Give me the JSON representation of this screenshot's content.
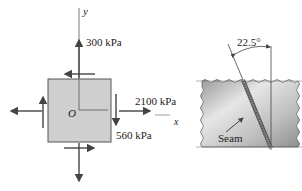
{
  "element": {
    "y_axis_label": "y",
    "x_axis_label": "x",
    "origin_label": "O",
    "normal_stress_y": "300 kPa",
    "normal_stress_x": "2100 kPa",
    "shear_stress": "560 kPa"
  },
  "plate": {
    "angle_label": "22.5°",
    "seam_label": "Seam"
  },
  "colors": {
    "element_fill": "#cfcfcf",
    "line": "#444444",
    "plate_fill": "#c4c4c4"
  }
}
